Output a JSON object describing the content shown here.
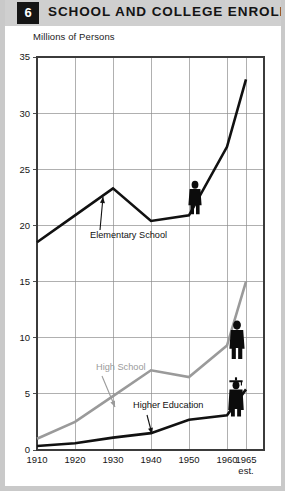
{
  "header": {
    "badge_number": "6",
    "title": "SCHOOL AND COLLEGE ENROLLMENT",
    "badge_color": "#151515",
    "bar_color": "#cfcfcf"
  },
  "chart_data": {
    "type": "line",
    "title": "SCHOOL AND COLLEGE ENROLLMENT",
    "ylabel": "Millions of Persons",
    "xlabel": "",
    "x": [
      1910,
      1920,
      1930,
      1940,
      1950,
      1960,
      1965
    ],
    "xtick_labels": [
      "1910",
      "1920",
      "1930",
      "1940",
      "1950",
      "1960",
      "1965"
    ],
    "xtick_sublabels": [
      "",
      "",
      "",
      "",
      "",
      "",
      "est."
    ],
    "ytick_labels": [
      "0",
      "5",
      "10",
      "15",
      "20",
      "25",
      "30",
      "35"
    ],
    "ytick_values": [
      0,
      5,
      10,
      15,
      20,
      25,
      30,
      35
    ],
    "ylim": [
      0,
      35
    ],
    "xlim": [
      1910,
      1965
    ],
    "grid": true,
    "legend": "none",
    "series": [
      {
        "name": "Elementary School",
        "color": "#111111",
        "values": [
          18.5,
          20.9,
          23.3,
          20.4,
          20.9,
          27.0,
          33.0
        ]
      },
      {
        "name": "High School",
        "color": "#9a9a9a",
        "values": [
          1.0,
          2.5,
          4.8,
          7.1,
          6.5,
          9.3,
          15.0
        ]
      },
      {
        "name": "Higher Education",
        "color": "#111111",
        "values": [
          0.35,
          0.6,
          1.1,
          1.5,
          2.7,
          3.1,
          5.4
        ]
      }
    ],
    "annotations": [
      {
        "label": "Elementary School",
        "color": "#111111",
        "series": "Elementary School"
      },
      {
        "label": "High School",
        "color": "#9a9a9a",
        "series": "High School"
      },
      {
        "label": "Higher Education",
        "color": "#111111",
        "series": "Higher Education"
      }
    ],
    "figures": [
      {
        "name": "person-figure-elementary",
        "series": "Elementary School",
        "has_cap": false
      },
      {
        "name": "person-figure-highschool",
        "series": "High School",
        "has_cap": false
      },
      {
        "name": "graduate-figure-higher-education",
        "series": "Higher Education",
        "has_cap": true
      }
    ]
  }
}
